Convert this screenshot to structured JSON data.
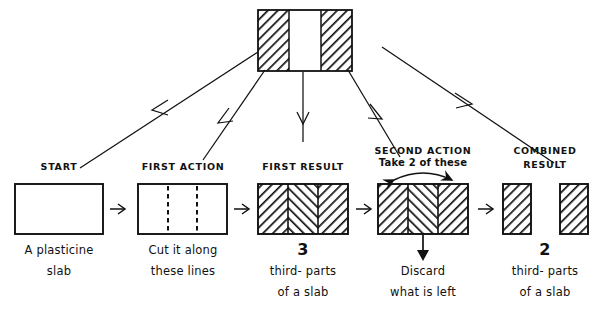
{
  "figure": {
    "style": "hand-drawn line diagram",
    "ink_color": "#111111",
    "paper_color": "#ffffff"
  },
  "top_shape": {
    "name": "slab-with-middle-removed",
    "sections": [
      "hatched",
      "blank",
      "hatched"
    ]
  },
  "columns": [
    {
      "id": "start",
      "title": "START",
      "subtitle": "",
      "caption_line1": "A plasticine",
      "caption_line2": "slab",
      "caption_number": "",
      "shape": "plain-rectangle"
    },
    {
      "id": "first-action",
      "title": "FIRST ACTION",
      "subtitle": "",
      "caption_line1": "Cut it along",
      "caption_line2": "these lines",
      "caption_number": "",
      "shape": "rectangle-with-two-dashed-cut-lines"
    },
    {
      "id": "first-result",
      "title": "FIRST RESULT",
      "subtitle": "",
      "caption_number": "3",
      "caption_line1": "third- parts",
      "caption_line2": "of a slab",
      "shape": "rectangle-three-hatched-thirds"
    },
    {
      "id": "second-action",
      "title": "SECOND ACTION",
      "subtitle": "Take 2 of these",
      "caption_number": "",
      "caption_line1": "Discard",
      "caption_line2": "what is left",
      "shape": "rectangle-three-hatched-thirds-with-span-arrow"
    },
    {
      "id": "combined-result",
      "title_line1": "COMBINED",
      "title_line2": "RESULT",
      "caption_number": "2",
      "caption_line1": "third- parts",
      "caption_line2": "of a slab",
      "shape": "two-separate-hatched-thirds"
    }
  ],
  "annotations": {
    "span_arrow_label": "Take 2 of these",
    "discard_arrow_label": "Discard"
  }
}
